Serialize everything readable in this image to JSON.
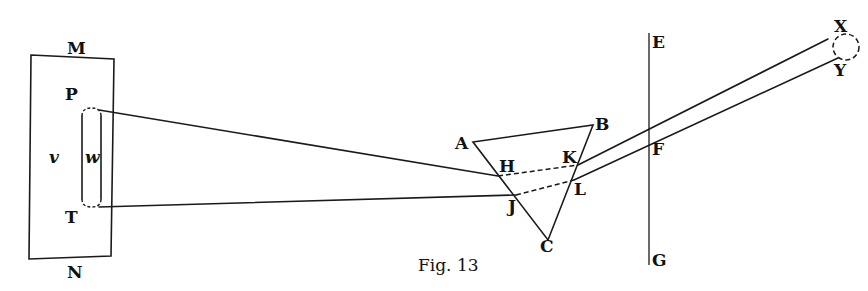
{
  "figure": {
    "caption": "Fig. 13",
    "labels": {
      "M": "M",
      "N": "N",
      "P": "P",
      "T": "T",
      "v": "v",
      "w": "w",
      "A": "A",
      "B": "B",
      "C": "C",
      "H": "H",
      "K": "K",
      "J": "J",
      "L": "L",
      "E": "E",
      "F": "F",
      "G": "G",
      "X": "X",
      "Y": "Y"
    },
    "elements": {
      "window_frame": "rectangle MN",
      "aperture": "slot PT with sides v and w",
      "prism": "triangle ABC",
      "screen": "vertical line EG crossing rays at F",
      "image": "dashed circle between X and Y"
    }
  }
}
